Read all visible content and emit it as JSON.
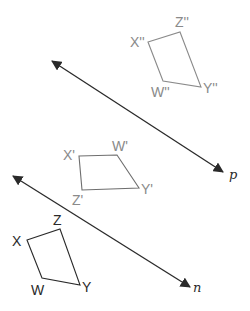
{
  "diagram": {
    "lines": [
      {
        "name": "p",
        "label": "p",
        "x1": 52,
        "y1": 61,
        "x2": 223,
        "y2": 172
      },
      {
        "name": "n",
        "label": "n",
        "x1": 13,
        "y1": 176,
        "x2": 190,
        "y2": 287
      }
    ],
    "shapes": [
      {
        "name": "original",
        "color": "#2a2a2a",
        "vertices": [
          {
            "label": "X",
            "x": 27,
            "y": 240
          },
          {
            "label": "Z",
            "x": 60,
            "y": 229
          },
          {
            "label": "Y",
            "x": 80,
            "y": 285
          },
          {
            "label": "W",
            "x": 42,
            "y": 278
          }
        ]
      },
      {
        "name": "first-image",
        "color": "#6e6e6e",
        "vertices": [
          {
            "label": "X'",
            "x": 79,
            "y": 156
          },
          {
            "label": "W'",
            "x": 117,
            "y": 155
          },
          {
            "label": "Y'",
            "x": 139,
            "y": 188
          },
          {
            "label": "Z'",
            "x": 82,
            "y": 190
          }
        ]
      },
      {
        "name": "second-image",
        "color": "#8a8a8a",
        "vertices": [
          {
            "label": "X''",
            "x": 148,
            "y": 42
          },
          {
            "label": "Z''",
            "x": 180,
            "y": 32
          },
          {
            "label": "Y''",
            "x": 201,
            "y": 87
          },
          {
            "label": "W''",
            "x": 163,
            "y": 81
          }
        ]
      }
    ],
    "labels": {
      "X": "X",
      "Z": "Z",
      "Y": "Y",
      "W": "W",
      "X1": "X'",
      "W1": "W'",
      "Y1": "Y'",
      "Z1": "Z'",
      "X2": "X''",
      "Z2": "Z''",
      "Y2": "Y''",
      "W2": "W''",
      "p": "p",
      "n": "n"
    }
  }
}
